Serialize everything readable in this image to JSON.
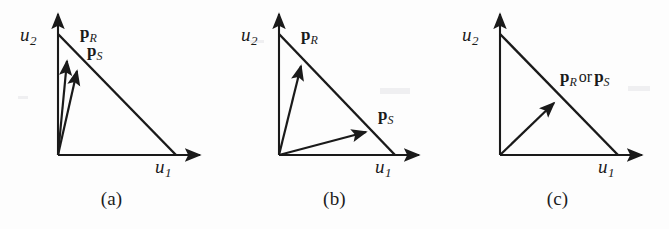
{
  "figure": {
    "background_color": "#fdfdfd",
    "stroke_color": "#1a1a1a",
    "width": 669,
    "height": 229
  },
  "panels": [
    {
      "id": "a",
      "caption": "(a)",
      "axis_x_label_base": "u",
      "axis_x_label_sub": "1",
      "axis_y_label_base": "u",
      "axis_y_label_sub": "2",
      "vectors": [
        {
          "name": "p_R",
          "bold": "p",
          "sub": "R",
          "tip_x": 67,
          "tip_y": 58
        },
        {
          "name": "p_S",
          "bold": "p",
          "sub": "S",
          "tip_x": 78,
          "tip_y": 68
        }
      ],
      "labels": [
        {
          "text_bold": "p",
          "text_sub": "R",
          "x": 82,
          "y": 26
        },
        {
          "text_bold": "p",
          "text_sub": "S",
          "x": 88,
          "y": 44
        }
      ]
    },
    {
      "id": "b",
      "caption": "(b)",
      "axis_x_label_base": "u",
      "axis_x_label_sub": "1",
      "axis_y_label_base": "u",
      "axis_y_label_sub": "2",
      "vectors": [
        {
          "name": "p_R",
          "bold": "p",
          "sub": "R",
          "tip_x": 301,
          "tip_y": 63
        },
        {
          "name": "p_S",
          "bold": "p",
          "sub": "S",
          "tip_x": 369,
          "tip_y": 132
        }
      ],
      "labels": [
        {
          "text_bold": "p",
          "text_sub": "R",
          "x": 301,
          "y": 27
        },
        {
          "text_bold": "p",
          "text_sub": "S",
          "x": 378,
          "y": 108
        }
      ]
    },
    {
      "id": "c",
      "caption": "(c)",
      "axis_x_label_base": "u",
      "axis_x_label_sub": "1",
      "axis_y_label_base": "u",
      "axis_y_label_sub": "2",
      "vectors": [
        {
          "name": "p_R or p_S",
          "bold": "p",
          "sub": "R",
          "conjunction": "or",
          "bold2": "p",
          "sub2": "S",
          "tip_x": 557,
          "tip_y": 99
        }
      ],
      "labels": [
        {
          "text_bold": "p",
          "text_sub": "R",
          "conjunction": "or",
          "text_bold2": "p",
          "text_sub2": "S",
          "x": 560,
          "y": 68
        }
      ]
    }
  ],
  "labels_flat": {
    "u1": "u",
    "u1_sub": "1",
    "u2": "u",
    "u2_sub": "2",
    "p": "p",
    "R": "R",
    "S": "S",
    "or": "or",
    "caption_a": "(a)",
    "caption_b": "(b)",
    "caption_c": "(c)"
  }
}
